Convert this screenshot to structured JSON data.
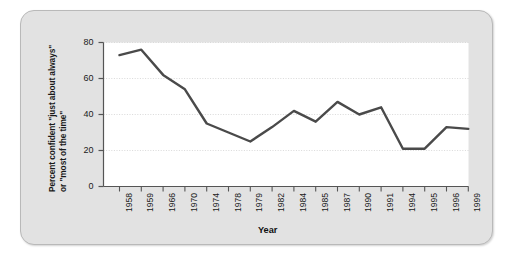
{
  "figure": {
    "panel_bg": "#e2e2e2",
    "plot_bg": "#ffffff",
    "line_color": "#4a4a4a",
    "grid_color": "#cfcfcf",
    "axis_color": "#555555"
  },
  "chart_data": {
    "type": "line",
    "title": "",
    "xlabel": "Year",
    "ylabel": "Percent confident \"just about always\" or \"most of the time\"",
    "ylabel_line1": "Percent confident \"just about always\"",
    "ylabel_line2": "or \"most of the time\"",
    "categories": [
      "1958",
      "1959",
      "1966",
      "1970",
      "1974",
      "1978",
      "1979",
      "1982",
      "1984",
      "1985",
      "1987",
      "1990",
      "1991",
      "1994",
      "1995",
      "1996",
      "1999"
    ],
    "values": [
      73,
      76,
      62,
      54,
      35,
      30,
      25,
      33,
      42,
      36,
      47,
      40,
      44,
      21,
      21,
      33,
      32
    ],
    "ylim": [
      0,
      80
    ],
    "yticks": [
      0,
      20,
      40,
      60,
      80
    ],
    "ytick_labels": [
      "0",
      "20",
      "40",
      "60",
      "80"
    ],
    "grid": true,
    "grid_axis": "y",
    "legend": "none",
    "series": [
      {
        "name": "Percent confident",
        "values": [
          73,
          76,
          62,
          54,
          35,
          30,
          25,
          33,
          42,
          36,
          47,
          40,
          44,
          21,
          21,
          33,
          32
        ]
      }
    ]
  }
}
